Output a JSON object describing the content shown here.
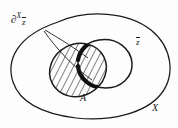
{
  "figure": {
    "type": "set-theory-venn-diagram",
    "background_color": "#fdfdfd",
    "stroke_color": "#1b1b1b",
    "labels": {
      "boundary_partial": "∂",
      "boundary_superscript": "X",
      "boundary_subscript": "z",
      "ambient_set": "X",
      "inner_set": "z",
      "hatched_set": "A"
    },
    "annotations": {
      "leader_lines": 2,
      "emphasis_arcs": 2,
      "hatching": "diagonal-lines"
    }
  }
}
